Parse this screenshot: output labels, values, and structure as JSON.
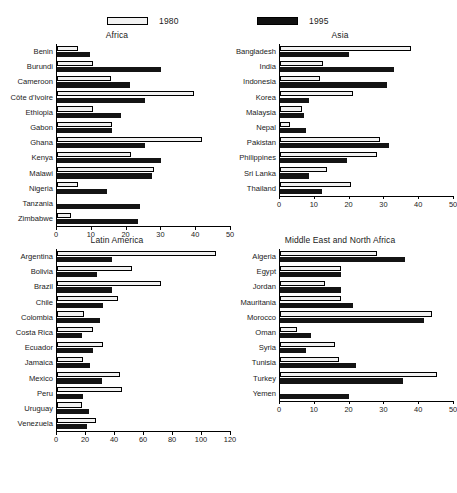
{
  "legend": {
    "items": [
      {
        "label": "1980",
        "key": "y1980",
        "color": "#f2f2f2",
        "style": "hollow"
      },
      {
        "label": "1995",
        "key": "y1995",
        "color": "#141414",
        "style": "filled"
      }
    ]
  },
  "chart_data": [
    {
      "type": "bar",
      "orientation": "horizontal",
      "title": "Africa",
      "xlabel": "",
      "ylabel": "",
      "xlim": [
        0,
        50
      ],
      "xticks": [
        0,
        10,
        20,
        30,
        40,
        50
      ],
      "grid": false,
      "legend_position": "top",
      "categories": [
        "Benin",
        "Burundi",
        "Cameroon",
        "Côte d'Ivoire",
        "Ethiopia",
        "Gabon",
        "Ghana",
        "Kenya",
        "Malawi",
        "Nigeria",
        "Tanzania",
        "Zimbabwe"
      ],
      "series": [
        {
          "name": "1980",
          "values": [
            6,
            10.5,
            15.5,
            39.5,
            10.5,
            16,
            42,
            21.5,
            28,
            6,
            0,
            4
          ]
        },
        {
          "name": "1995",
          "values": [
            9.5,
            30,
            21,
            25.5,
            18.5,
            16,
            25.5,
            30,
            27.5,
            14.5,
            24,
            23.5
          ]
        }
      ]
    },
    {
      "type": "bar",
      "orientation": "horizontal",
      "title": "Asia",
      "xlabel": "",
      "ylabel": "",
      "xlim": [
        0,
        50
      ],
      "xticks": [
        0,
        10,
        20,
        30,
        40,
        50
      ],
      "grid": false,
      "legend_position": "top",
      "categories": [
        "Bangladesh",
        "India",
        "Indonesia",
        "Korea",
        "Malaysia",
        "Nepal",
        "Pakistan",
        "Philippines",
        "Sri Lanka",
        "Thailand"
      ],
      "series": [
        {
          "name": "1980",
          "values": [
            38,
            12.5,
            11.5,
            21,
            6.5,
            3,
            29,
            28,
            13.5,
            20.5
          ]
        },
        {
          "name": "1995",
          "values": [
            20,
            33,
            31,
            8.5,
            7,
            7.5,
            31.5,
            19.5,
            8.5,
            12
          ]
        }
      ]
    },
    {
      "type": "bar",
      "orientation": "horizontal",
      "title": "Latin America",
      "xlabel": "",
      "ylabel": "",
      "xlim": [
        0,
        120
      ],
      "xticks": [
        0,
        20,
        40,
        60,
        80,
        100,
        120
      ],
      "grid": false,
      "legend_position": "top",
      "categories": [
        "Argentina",
        "Bolivia",
        "Brazil",
        "Chile",
        "Colombia",
        "Costa Rica",
        "Ecuador",
        "Jamaica",
        "Mexico",
        "Peru",
        "Uruguay",
        "Venezuela"
      ],
      "series": [
        {
          "name": "1980",
          "values": [
            110,
            52,
            72,
            42,
            19,
            25,
            32,
            18,
            44,
            45,
            17,
            27
          ]
        },
        {
          "name": "1995",
          "values": [
            38,
            28,
            38,
            32,
            30,
            17,
            25,
            23,
            31,
            18,
            22,
            21
          ]
        }
      ]
    },
    {
      "type": "bar",
      "orientation": "horizontal",
      "title": "Middle East and North Africa",
      "xlabel": "",
      "ylabel": "",
      "xlim": [
        0,
        50
      ],
      "xticks": [
        0,
        10,
        20,
        30,
        40,
        50
      ],
      "grid": false,
      "legend_position": "top",
      "categories": [
        "Algeria",
        "Egypt",
        "Jordan",
        "Mauritania",
        "Morocco",
        "Oman",
        "Syria",
        "Tunisia",
        "Turkey",
        "Yemen"
      ],
      "series": [
        {
          "name": "1980",
          "values": [
            28,
            17.5,
            13,
            17.5,
            44,
            5,
            16,
            17,
            45.5,
            0
          ]
        },
        {
          "name": "1995",
          "values": [
            36,
            17.5,
            17.5,
            21,
            41.5,
            9,
            7.5,
            22,
            35.5,
            20
          ]
        }
      ]
    }
  ]
}
